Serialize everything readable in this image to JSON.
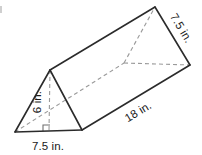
{
  "figure": {
    "type": "triangular-prism",
    "shape_name": "triangular prism",
    "labels": {
      "base_width": "7.5 in.",
      "triangle_height": "6 in.",
      "prism_length": "18 in.",
      "slant_side": "7.5 in."
    },
    "colors": {
      "solid_edge": "#2b2b2b",
      "hidden_edge": "#9a9a9a",
      "face": "#ffffff",
      "text": "#1a1a1a",
      "background": "#ffffff"
    },
    "geometry": {
      "front_bottom_left": [
        15,
        132
      ],
      "front_bottom_right": [
        82,
        130
      ],
      "front_apex": [
        50,
        70
      ],
      "back_apex": [
        155,
        7
      ],
      "back_bottom_right": [
        190,
        65
      ],
      "back_bottom_hidden": [
        124,
        63
      ]
    }
  }
}
